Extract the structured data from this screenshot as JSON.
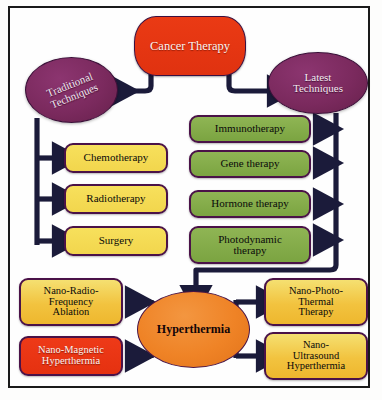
{
  "figure": {
    "frame": {
      "border_color": "#1a1a1a",
      "background": "#fefefe"
    }
  },
  "palette": {
    "root_red": "#e83415",
    "ellipse_purple": "#7b2a5e",
    "ellipse_orange": "#ef8326",
    "box_yellow": "#f4d94f",
    "box_gold": "#f2c33f",
    "box_green": "#7fa845",
    "box_red": "#e53110",
    "arrow_navy": "#1b1b3a",
    "border_purple": "#4a1248"
  },
  "nodes": {
    "root": {
      "label": "Cancer Therapy"
    },
    "traditional": {
      "label": "Traditional Techniques",
      "line1": "Traditional",
      "line2": "Techniques"
    },
    "latest": {
      "label": "Latest Techniques",
      "line1": "Latest",
      "line2": "Techniques"
    },
    "hyperthermia": {
      "label": "Hyperthermia"
    }
  },
  "traditional_items": [
    {
      "label": "Chemotherapy"
    },
    {
      "label": "Radiotherapy"
    },
    {
      "label": "Surgery"
    }
  ],
  "latest_items": [
    {
      "label": "Immunotherapy",
      "line1": "Immunotherapy",
      "line2": ""
    },
    {
      "label": "Gene therapy",
      "line1": "Gene therapy",
      "line2": ""
    },
    {
      "label": "Hormone therapy",
      "line1": "Hormone therapy",
      "line2": ""
    },
    {
      "label": "Photodynamic therapy",
      "line1": "Photodynamic",
      "line2": "therapy"
    }
  ],
  "hyperthermia_items": {
    "top_left": {
      "label": "Nano-Radio-Frequency Ablation",
      "line1": "Nano-Radio-",
      "line2": "Frequency",
      "line3": "Ablation"
    },
    "bottom_left": {
      "label": "Nano-Magnetic Hyperthermia",
      "line1": "Nano-Magnetic",
      "line2": "Hyperthermia",
      "line3": ""
    },
    "top_right": {
      "label": "Nano-Photo-Thermal Therapy",
      "line1": "Nano-Photo-",
      "line2": "Thermal",
      "line3": "Therapy"
    },
    "bottom_right": {
      "label": "Nano-Ultrasound Hyperthermia",
      "line1": "Nano-",
      "line2": "Ultrasound",
      "line3": "Hyperthermia"
    }
  }
}
